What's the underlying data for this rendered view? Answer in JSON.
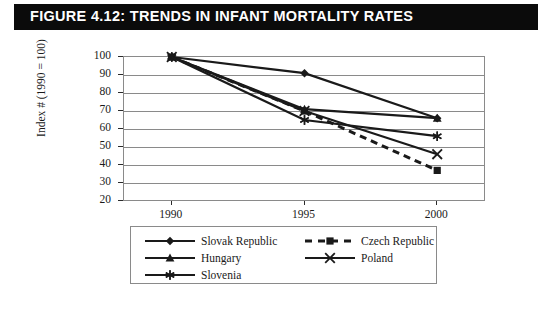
{
  "figure": {
    "caption_label": "Figure 4.12:",
    "caption_title": "Trends in Infant Mortality Rates",
    "caption_full": "FIGURE 4.12:  TRENDS IN INFANT MORTALITY RATES"
  },
  "colors": {
    "banner_background": "#0b0b0b",
    "banner_text": "#ffffff",
    "plot_background": "#ffffff",
    "gridline": "#8a8a8a",
    "series_line": "#1a1a1a",
    "frame": "#1a1a1a"
  },
  "chart_data": {
    "type": "line",
    "title": "Trends in Infant Mortality Rates",
    "xlabel": "",
    "ylabel": "Index # (1990 = 100)",
    "x": [
      1990,
      1995,
      2000
    ],
    "categories": [
      "1990",
      "1995",
      "2000"
    ],
    "xtick_labels": [
      "1990",
      "1995",
      "2000"
    ],
    "ytick_labels": [
      "100",
      "90",
      "80",
      "70",
      "60",
      "50",
      "40",
      "30",
      "20"
    ],
    "yticks": [
      100,
      90,
      80,
      70,
      60,
      50,
      40,
      30,
      20
    ],
    "ylim": [
      20,
      100
    ],
    "xlim": [
      1988.2,
      2001.8
    ],
    "grid": true,
    "legend_position": "bottom",
    "series": [
      {
        "name": "Slovak Republic",
        "marker": "diamond",
        "dash": "solid",
        "values": [
          100,
          91,
          66
        ]
      },
      {
        "name": "Czech Republic",
        "marker": "square",
        "dash": "dashed",
        "values": [
          100,
          70,
          37
        ]
      },
      {
        "name": "Hungary",
        "marker": "triangle",
        "dash": "solid",
        "values": [
          100,
          71,
          66
        ]
      },
      {
        "name": "Poland",
        "marker": "cross",
        "dash": "solid",
        "values": [
          100,
          70,
          46
        ]
      },
      {
        "name": "Slovenia",
        "marker": "asterisk",
        "dash": "solid",
        "values": [
          100,
          65,
          56
        ]
      }
    ]
  },
  "legend": {
    "entries": [
      {
        "label": "Slovak Republic",
        "marker": "diamond",
        "dash": "solid"
      },
      {
        "label": "Czech Republic",
        "marker": "square",
        "dash": "dashed"
      },
      {
        "label": "Hungary",
        "marker": "triangle",
        "dash": "solid"
      },
      {
        "label": "Poland",
        "marker": "cross",
        "dash": "solid"
      },
      {
        "label": "Slovenia",
        "marker": "asterisk",
        "dash": "solid"
      }
    ]
  }
}
